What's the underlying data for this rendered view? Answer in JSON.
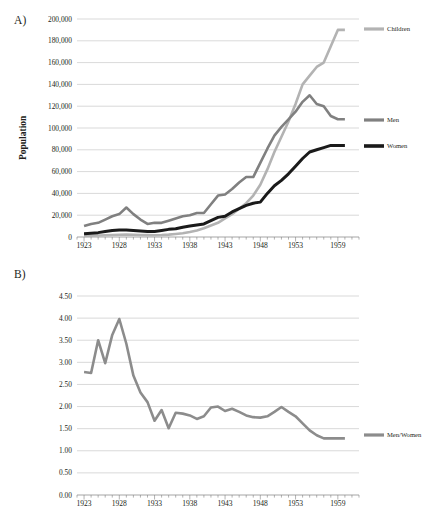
{
  "figure": {
    "panels": [
      {
        "id": "A",
        "letter": "A)",
        "ylabel": "Population"
      },
      {
        "id": "B",
        "letter": "B)",
        "ylabel": "Ratio of adult men per adult woman"
      }
    ]
  },
  "colors": {
    "children": "#b3b3b3",
    "men": "#808080",
    "women": "#1a1a1a",
    "ratio": "#8c8c8c",
    "grid": "#bfbfbf",
    "axis": "#7f7f7f",
    "text": "#231f20",
    "background": "#ffffff"
  },
  "chart_data": [
    {
      "type": "line",
      "panel": "A",
      "title": "",
      "xlabel": "",
      "ylabel": "Population",
      "xlim": [
        1922,
        1962
      ],
      "ylim": [
        0,
        200000
      ],
      "ytick_labels": [
        "0",
        "20,000",
        "40,000",
        "60,000",
        "80,000",
        "100,000",
        "120,000",
        "140,000",
        "160,000",
        "180,000",
        "200,000"
      ],
      "ytick_values": [
        0,
        20000,
        40000,
        60000,
        80000,
        100000,
        120000,
        140000,
        160000,
        180000,
        200000
      ],
      "xtick_labels": [
        "1923",
        "1928",
        "1933",
        "1938",
        "1943",
        "1948",
        "1953",
        "1959"
      ],
      "xtick_values": [
        1923,
        1928,
        1933,
        1938,
        1943,
        1948,
        1953,
        1959
      ],
      "grid": true,
      "legend_position": "right",
      "x": [
        1923,
        1924,
        1925,
        1926,
        1927,
        1928,
        1929,
        1930,
        1931,
        1932,
        1933,
        1934,
        1935,
        1936,
        1937,
        1938,
        1939,
        1940,
        1941,
        1942,
        1943,
        1944,
        1945,
        1946,
        1947,
        1948,
        1949,
        1950,
        1951,
        1952,
        1953,
        1954,
        1955,
        1956,
        1957,
        1958,
        1959,
        1960
      ],
      "series": [
        {
          "name": "Children",
          "color": "#b3b3b3",
          "values": [
            1000,
            1200,
            1400,
            1600,
            1800,
            2000,
            2200,
            2000,
            1800,
            1700,
            1600,
            1800,
            2200,
            2800,
            3500,
            4500,
            6000,
            8000,
            10500,
            13000,
            17000,
            21000,
            26000,
            31000,
            38000,
            48000,
            62000,
            78000,
            92000,
            106000,
            122000,
            140000,
            148000,
            156000,
            160000,
            175000,
            190000,
            190000
          ]
        },
        {
          "name": "Men",
          "color": "#808080",
          "values": [
            10000,
            12000,
            13000,
            16000,
            19000,
            21000,
            27000,
            21000,
            16000,
            12000,
            13000,
            13000,
            15000,
            17000,
            19000,
            20000,
            22000,
            22000,
            30000,
            38000,
            39000,
            44000,
            50000,
            55000,
            55000,
            68000,
            81000,
            93000,
            101000,
            108000,
            115000,
            124000,
            130000,
            122000,
            120000,
            111000,
            108000,
            108000
          ]
        },
        {
          "name": "Women",
          "color": "#1a1a1a",
          "values": [
            3000,
            3500,
            4000,
            5000,
            6000,
            6500,
            6500,
            6000,
            5500,
            5000,
            5000,
            6000,
            7000,
            7500,
            9000,
            10000,
            11000,
            12000,
            15000,
            18000,
            19000,
            23000,
            26000,
            29000,
            31000,
            32000,
            40000,
            47000,
            52000,
            58000,
            65000,
            72000,
            78000,
            80000,
            82000,
            84000,
            84000,
            84000
          ]
        }
      ]
    },
    {
      "type": "line",
      "panel": "B",
      "title": "",
      "xlabel": "",
      "ylabel": "Ratio of adult men per adult woman",
      "xlim": [
        1922,
        1962
      ],
      "ylim": [
        0,
        4.5
      ],
      "ytick_labels": [
        "0.00",
        "0.50",
        "1.00",
        "1.50",
        "2.00",
        "2.50",
        "3.00",
        "3.50",
        "4.00",
        "4.50"
      ],
      "ytick_values": [
        0,
        0.5,
        1.0,
        1.5,
        2.0,
        2.5,
        3.0,
        3.5,
        4.0,
        4.5
      ],
      "xtick_labels": [
        "1923",
        "1928",
        "1933",
        "1938",
        "1943",
        "1948",
        "1953",
        "1959"
      ],
      "xtick_values": [
        1923,
        1928,
        1933,
        1938,
        1943,
        1948,
        1953,
        1959
      ],
      "grid": true,
      "legend_position": "right",
      "x": [
        1923,
        1924,
        1925,
        1926,
        1927,
        1928,
        1929,
        1930,
        1931,
        1932,
        1933,
        1934,
        1935,
        1936,
        1937,
        1938,
        1939,
        1940,
        1941,
        1942,
        1943,
        1944,
        1945,
        1946,
        1947,
        1948,
        1949,
        1950,
        1951,
        1952,
        1953,
        1954,
        1955,
        1956,
        1957,
        1958,
        1959,
        1960
      ],
      "series": [
        {
          "name": "Men/Women",
          "color": "#8c8c8c",
          "values": [
            2.78,
            2.76,
            3.5,
            2.98,
            3.62,
            3.98,
            3.42,
            2.7,
            2.32,
            2.1,
            1.68,
            1.92,
            1.51,
            1.86,
            1.84,
            1.8,
            1.72,
            1.78,
            1.98,
            2.0,
            1.9,
            1.95,
            1.88,
            1.8,
            1.76,
            1.75,
            1.78,
            1.88,
            1.99,
            1.88,
            1.78,
            1.62,
            1.46,
            1.35,
            1.28,
            1.28,
            1.28,
            1.28
          ]
        }
      ]
    }
  ]
}
